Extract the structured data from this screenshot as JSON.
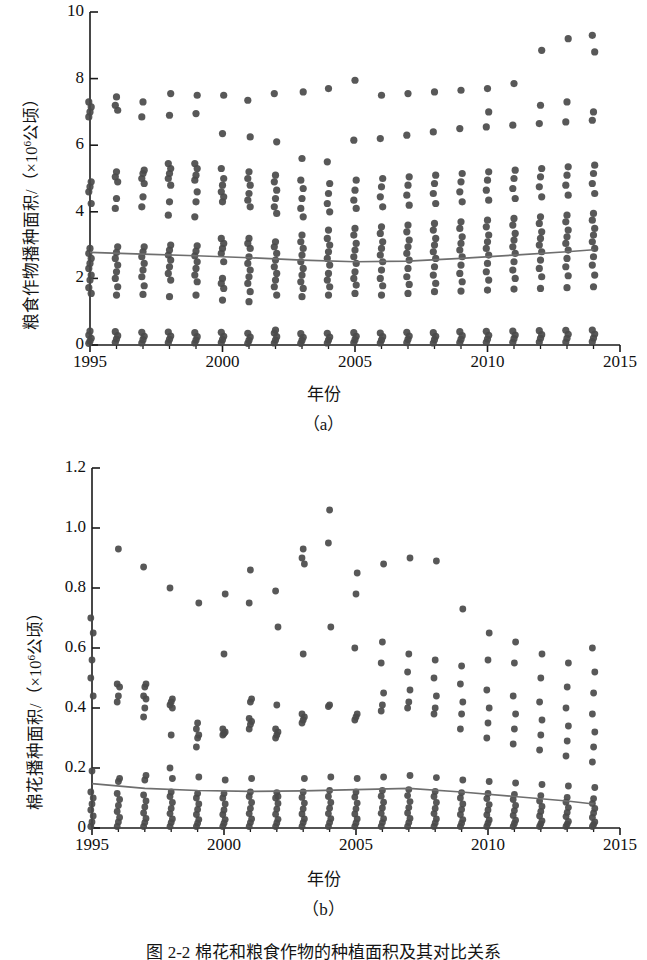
{
  "figure": {
    "caption": "图 2-2  棉花和粮食作物的种植面积及其对比关系",
    "panels": [
      "（a）",
      "（b）"
    ]
  },
  "chart_data": [
    {
      "type": "scatter",
      "id": "panel-a",
      "title": "",
      "panel_label": "（a）",
      "xlabel": "年份",
      "ylabel_text": "粮食作物播种面积/（×10",
      "ylabel_sup": "6",
      "ylabel_tail": "公顷）",
      "ylabel": "粮食作物播种面积/（×10⁶公顷）",
      "xlim": [
        1995,
        2015
      ],
      "ylim": [
        0,
        10
      ],
      "xticks": [
        1995,
        2000,
        2005,
        2010,
        2015
      ],
      "xtick_labels": [
        "1995",
        "2000",
        "2005",
        "2010",
        "2015"
      ],
      "yticks": [
        0,
        2,
        4,
        6,
        8,
        10
      ],
      "ytick_labels": [
        "0",
        "2",
        "4",
        "6",
        "8",
        "10"
      ],
      "minor_xticks_every": 1,
      "grid": false,
      "legend": "none",
      "marker_color": "#4a4a4a",
      "trend_color": "#6e6e6e",
      "trend_line": [
        {
          "x": 1995,
          "y": 2.78
        },
        {
          "x": 1997,
          "y": 2.73
        },
        {
          "x": 1999,
          "y": 2.68
        },
        {
          "x": 2001,
          "y": 2.62
        },
        {
          "x": 2003,
          "y": 2.55
        },
        {
          "x": 2005,
          "y": 2.5
        },
        {
          "x": 2007,
          "y": 2.52
        },
        {
          "x": 2009,
          "y": 2.6
        },
        {
          "x": 2011,
          "y": 2.7
        },
        {
          "x": 2013,
          "y": 2.8
        },
        {
          "x": 2014,
          "y": 2.86
        }
      ],
      "series": [
        {
          "year": 1995,
          "values": [
            0.05,
            0.12,
            0.2,
            0.3,
            0.42,
            1.55,
            1.72,
            1.95,
            2.1,
            2.3,
            2.45,
            2.6,
            2.75,
            2.9,
            4.25,
            4.6,
            4.75,
            4.9,
            6.85,
            7.0,
            7.15,
            7.3
          ]
        },
        {
          "year": 1996,
          "values": [
            0.08,
            0.18,
            0.28,
            0.4,
            1.5,
            1.75,
            2.0,
            2.2,
            2.4,
            2.6,
            2.78,
            2.95,
            4.1,
            4.4,
            4.9,
            5.05,
            5.2,
            7.05,
            7.2,
            7.45
          ]
        },
        {
          "year": 1997,
          "values": [
            0.06,
            0.16,
            0.26,
            0.38,
            1.52,
            1.78,
            2.05,
            2.25,
            2.45,
            2.65,
            2.8,
            2.95,
            4.15,
            4.45,
            4.85,
            5.0,
            5.15,
            5.25,
            6.85,
            7.3
          ]
        },
        {
          "year": 1998,
          "values": [
            0.07,
            0.17,
            0.27,
            0.39,
            1.45,
            1.95,
            2.15,
            2.35,
            2.55,
            2.7,
            2.85,
            3.0,
            3.9,
            4.3,
            4.8,
            5.0,
            5.15,
            5.3,
            5.45,
            6.9,
            7.55
          ]
        },
        {
          "year": 1999,
          "values": [
            0.06,
            0.15,
            0.25,
            0.37,
            1.5,
            1.9,
            2.1,
            2.3,
            2.5,
            2.68,
            2.82,
            2.98,
            3.85,
            4.3,
            4.6,
            4.95,
            5.1,
            5.3,
            5.45,
            6.95,
            7.5
          ]
        },
        {
          "year": 2000,
          "values": [
            0.07,
            0.16,
            0.26,
            0.38,
            1.35,
            1.7,
            1.85,
            2.0,
            2.5,
            2.75,
            2.9,
            3.05,
            3.2,
            4.3,
            4.45,
            4.6,
            4.8,
            5.0,
            5.3,
            6.35,
            7.5
          ]
        },
        {
          "year": 2001,
          "values": [
            0.05,
            0.14,
            0.24,
            0.35,
            1.3,
            1.6,
            1.85,
            2.05,
            2.25,
            2.45,
            2.65,
            2.9,
            3.05,
            3.2,
            4.15,
            4.35,
            4.55,
            4.8,
            5.0,
            5.2,
            6.25,
            7.35
          ]
        },
        {
          "year": 2002,
          "values": [
            0.06,
            0.15,
            0.25,
            0.36,
            0.45,
            1.5,
            1.75,
            1.95,
            2.15,
            2.35,
            2.55,
            2.75,
            2.95,
            3.1,
            3.95,
            4.15,
            4.4,
            4.65,
            4.9,
            5.1,
            6.1,
            7.55
          ]
        },
        {
          "year": 2003,
          "values": [
            0.05,
            0.14,
            0.23,
            0.34,
            1.45,
            1.7,
            1.9,
            2.1,
            2.3,
            2.5,
            2.7,
            2.9,
            3.1,
            3.3,
            3.85,
            4.1,
            4.4,
            4.7,
            4.95,
            5.6,
            7.6
          ]
        },
        {
          "year": 2004,
          "values": [
            0.06,
            0.15,
            0.24,
            0.35,
            1.5,
            1.75,
            1.95,
            2.15,
            2.4,
            2.6,
            2.8,
            3.0,
            3.2,
            3.45,
            4.0,
            4.25,
            4.55,
            4.85,
            5.5,
            7.7
          ]
        },
        {
          "year": 2005,
          "values": [
            0.07,
            0.16,
            0.26,
            0.37,
            1.55,
            1.8,
            2.0,
            2.2,
            2.45,
            2.65,
            2.85,
            3.05,
            3.3,
            3.5,
            4.1,
            4.35,
            4.65,
            4.95,
            6.15,
            7.95
          ]
        },
        {
          "year": 2006,
          "values": [
            0.06,
            0.15,
            0.25,
            0.36,
            1.5,
            1.78,
            2.0,
            2.25,
            2.5,
            2.7,
            2.9,
            3.1,
            3.35,
            3.55,
            4.15,
            4.45,
            4.75,
            5.0,
            6.2,
            7.5
          ]
        },
        {
          "year": 2007,
          "values": [
            0.07,
            0.17,
            0.27,
            0.38,
            1.55,
            1.82,
            2.05,
            2.3,
            2.55,
            2.75,
            2.95,
            3.15,
            3.4,
            3.6,
            4.2,
            4.5,
            4.8,
            5.05,
            6.3,
            7.55
          ]
        },
        {
          "year": 2008,
          "values": [
            0.06,
            0.16,
            0.26,
            0.37,
            1.6,
            1.85,
            2.1,
            2.35,
            2.6,
            2.8,
            3.0,
            3.2,
            3.45,
            3.65,
            4.25,
            4.55,
            4.85,
            5.1,
            6.4,
            7.6
          ]
        },
        {
          "year": 2009,
          "values": [
            0.07,
            0.17,
            0.28,
            0.4,
            1.62,
            1.9,
            2.15,
            2.4,
            2.65,
            2.85,
            3.05,
            3.25,
            3.5,
            3.7,
            4.3,
            4.6,
            4.9,
            5.15,
            6.5,
            7.65
          ]
        },
        {
          "year": 2010,
          "values": [
            0.08,
            0.18,
            0.29,
            0.41,
            1.65,
            1.95,
            2.2,
            2.45,
            2.7,
            2.9,
            3.1,
            3.3,
            3.55,
            3.75,
            4.35,
            4.65,
            4.95,
            5.2,
            6.55,
            7.7,
            7.0
          ]
        },
        {
          "year": 2011,
          "values": [
            0.08,
            0.19,
            0.3,
            0.42,
            1.68,
            2.0,
            2.25,
            2.5,
            2.75,
            2.95,
            3.15,
            3.35,
            3.6,
            3.8,
            4.4,
            4.7,
            5.0,
            5.25,
            6.6,
            7.85
          ]
        },
        {
          "year": 2012,
          "values": [
            0.09,
            0.2,
            0.31,
            0.43,
            1.7,
            2.05,
            2.3,
            2.55,
            2.8,
            3.0,
            3.2,
            3.4,
            3.65,
            3.85,
            4.45,
            4.75,
            5.05,
            5.3,
            6.65,
            7.2,
            8.85
          ]
        },
        {
          "year": 2013,
          "values": [
            0.09,
            0.2,
            0.32,
            0.44,
            1.72,
            2.08,
            2.35,
            2.6,
            2.85,
            3.05,
            3.25,
            3.45,
            3.7,
            3.9,
            4.5,
            4.8,
            5.1,
            5.35,
            6.7,
            7.3,
            9.2
          ]
        },
        {
          "year": 2014,
          "values": [
            0.1,
            0.21,
            0.33,
            0.45,
            1.75,
            2.1,
            2.4,
            2.65,
            2.9,
            3.1,
            3.3,
            3.5,
            3.75,
            3.95,
            4.55,
            4.85,
            5.15,
            5.4,
            6.75,
            7.0,
            8.8,
            9.3
          ]
        }
      ]
    },
    {
      "type": "scatter",
      "id": "panel-b",
      "title": "",
      "panel_label": "（b）",
      "xlabel": "年份",
      "ylabel_text": "棉花播种面积/（×10",
      "ylabel_sup": "6",
      "ylabel_tail": "公顷）",
      "ylabel": "棉花播种面积/（×10⁶公顷）",
      "xlim": [
        1995,
        2015
      ],
      "ylim": [
        0,
        1.2
      ],
      "xticks": [
        1995,
        2000,
        2005,
        2010,
        2015
      ],
      "xtick_labels": [
        "1995",
        "2000",
        "2005",
        "2010",
        "2015"
      ],
      "yticks": [
        0,
        0.2,
        0.4,
        0.6,
        0.8,
        1.0,
        1.2
      ],
      "ytick_labels": [
        "0",
        "0.2",
        "0.4",
        "0.6",
        "0.8",
        "1.0",
        "1.2"
      ],
      "minor_xticks_every": 1,
      "grid": false,
      "legend": "none",
      "marker_color": "#4a4a4a",
      "trend_color": "#6e6e6e",
      "trend_line": [
        {
          "x": 1995,
          "y": 0.148
        },
        {
          "x": 1997,
          "y": 0.132
        },
        {
          "x": 1999,
          "y": 0.125
        },
        {
          "x": 2001,
          "y": 0.122
        },
        {
          "x": 2003,
          "y": 0.124
        },
        {
          "x": 2005,
          "y": 0.128
        },
        {
          "x": 2007,
          "y": 0.132
        },
        {
          "x": 2009,
          "y": 0.12
        },
        {
          "x": 2011,
          "y": 0.105
        },
        {
          "x": 2013,
          "y": 0.09
        },
        {
          "x": 2014,
          "y": 0.08
        }
      ],
      "series": [
        {
          "year": 1995,
          "values": [
            0.005,
            0.02,
            0.04,
            0.06,
            0.08,
            0.1,
            0.12,
            0.19,
            0.44,
            0.5,
            0.56,
            0.65,
            0.7
          ]
        },
        {
          "year": 1996,
          "values": [
            0.005,
            0.02,
            0.035,
            0.055,
            0.075,
            0.095,
            0.115,
            0.155,
            0.165,
            0.42,
            0.44,
            0.47,
            0.48,
            0.93
          ]
        },
        {
          "year": 1997,
          "values": [
            0.005,
            0.018,
            0.032,
            0.05,
            0.07,
            0.09,
            0.11,
            0.16,
            0.175,
            0.37,
            0.4,
            0.43,
            0.44,
            0.47,
            0.48,
            0.87
          ]
        },
        {
          "year": 1998,
          "values": [
            0.005,
            0.018,
            0.03,
            0.048,
            0.065,
            0.085,
            0.105,
            0.12,
            0.165,
            0.2,
            0.31,
            0.4,
            0.41,
            0.42,
            0.43,
            0.8
          ]
        },
        {
          "year": 1999,
          "values": [
            0.005,
            0.016,
            0.028,
            0.045,
            0.062,
            0.08,
            0.1,
            0.115,
            0.17,
            0.27,
            0.3,
            0.31,
            0.33,
            0.35,
            0.75
          ]
        },
        {
          "year": 2000,
          "values": [
            0.005,
            0.016,
            0.028,
            0.045,
            0.06,
            0.08,
            0.1,
            0.115,
            0.16,
            0.31,
            0.315,
            0.32,
            0.33,
            0.58,
            0.78
          ]
        },
        {
          "year": 2001,
          "values": [
            0.005,
            0.018,
            0.03,
            0.048,
            0.065,
            0.085,
            0.105,
            0.12,
            0.165,
            0.33,
            0.345,
            0.355,
            0.365,
            0.42,
            0.43,
            0.75,
            0.86
          ]
        },
        {
          "year": 2002,
          "values": [
            0.005,
            0.017,
            0.029,
            0.046,
            0.063,
            0.082,
            0.1,
            0.118,
            0.105,
            0.3,
            0.31,
            0.32,
            0.33,
            0.41,
            0.67,
            0.79
          ]
        },
        {
          "year": 2003,
          "values": [
            0.005,
            0.018,
            0.03,
            0.047,
            0.064,
            0.083,
            0.102,
            0.12,
            0.165,
            0.35,
            0.36,
            0.37,
            0.38,
            0.58,
            0.88,
            0.9,
            0.93
          ]
        },
        {
          "year": 2004,
          "values": [
            0.005,
            0.018,
            0.031,
            0.048,
            0.066,
            0.085,
            0.105,
            0.125,
            0.17,
            0.405,
            0.41,
            0.67,
            0.95,
            1.06
          ]
        },
        {
          "year": 2005,
          "values": [
            0.005,
            0.017,
            0.03,
            0.047,
            0.064,
            0.083,
            0.103,
            0.12,
            0.165,
            0.36,
            0.37,
            0.38,
            0.6,
            0.78,
            0.85
          ]
        },
        {
          "year": 2006,
          "values": [
            0.005,
            0.018,
            0.031,
            0.049,
            0.067,
            0.086,
            0.106,
            0.125,
            0.17,
            0.39,
            0.41,
            0.45,
            0.55,
            0.62,
            0.88
          ]
        },
        {
          "year": 2007,
          "values": [
            0.005,
            0.018,
            0.032,
            0.05,
            0.068,
            0.088,
            0.108,
            0.128,
            0.175,
            0.4,
            0.42,
            0.46,
            0.52,
            0.58,
            0.9
          ]
        },
        {
          "year": 2008,
          "values": [
            0.005,
            0.017,
            0.03,
            0.048,
            0.065,
            0.085,
            0.105,
            0.122,
            0.168,
            0.38,
            0.4,
            0.44,
            0.5,
            0.56,
            0.89
          ]
        },
        {
          "year": 2009,
          "values": [
            0.005,
            0.016,
            0.028,
            0.045,
            0.062,
            0.08,
            0.1,
            0.118,
            0.16,
            0.33,
            0.38,
            0.42,
            0.48,
            0.54,
            0.73
          ]
        },
        {
          "year": 2010,
          "values": [
            0.005,
            0.016,
            0.027,
            0.044,
            0.06,
            0.078,
            0.098,
            0.115,
            0.155,
            0.3,
            0.35,
            0.4,
            0.46,
            0.56,
            0.65
          ]
        },
        {
          "year": 2011,
          "values": [
            0.005,
            0.015,
            0.026,
            0.042,
            0.058,
            0.075,
            0.095,
            0.112,
            0.15,
            0.28,
            0.33,
            0.38,
            0.44,
            0.55,
            0.62
          ]
        },
        {
          "year": 2012,
          "values": [
            0.005,
            0.014,
            0.024,
            0.04,
            0.055,
            0.072,
            0.09,
            0.108,
            0.145,
            0.26,
            0.31,
            0.36,
            0.42,
            0.5,
            0.58
          ]
        },
        {
          "year": 2013,
          "values": [
            0.005,
            0.013,
            0.022,
            0.038,
            0.052,
            0.068,
            0.086,
            0.102,
            0.14,
            0.24,
            0.29,
            0.34,
            0.4,
            0.47,
            0.55
          ]
        },
        {
          "year": 2014,
          "values": [
            0.005,
            0.012,
            0.02,
            0.035,
            0.05,
            0.065,
            0.082,
            0.098,
            0.135,
            0.22,
            0.27,
            0.32,
            0.38,
            0.45,
            0.52,
            0.6
          ]
        }
      ]
    }
  ]
}
